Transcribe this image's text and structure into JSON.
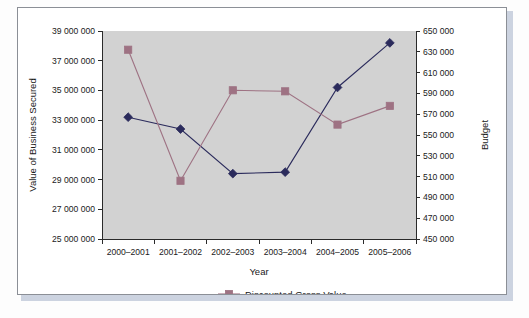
{
  "chart_data": {
    "type": "line",
    "title": "",
    "xlabel": "Year",
    "ylabel": "Value of Business Secured",
    "y2label": "Budget",
    "categories": [
      "2000–2001",
      "2001–2002",
      "2002–2003",
      "2003–2004",
      "2004–2005",
      "2005–2006"
    ],
    "ylim": [
      25000000,
      39000000
    ],
    "yticks": [
      25000000,
      27000000,
      29000000,
      31000000,
      33000000,
      35000000,
      37000000,
      39000000
    ],
    "ytick_labels": [
      "25 000 000",
      "27 000 000",
      "29 000 000",
      "31 000 000",
      "33 000 000",
      "35 000 000",
      "37 000 000",
      "39 000 000"
    ],
    "y2lim": [
      450000,
      650000
    ],
    "y2ticks": [
      450000,
      470000,
      490000,
      510000,
      530000,
      550000,
      570000,
      590000,
      610000,
      630000,
      650000
    ],
    "y2tick_labels": [
      "450 000",
      "470 000",
      "490 000",
      "510 000",
      "530 000",
      "550 000",
      "570 000",
      "590 000",
      "610 000",
      "630 000",
      "650 000"
    ],
    "grid": false,
    "legend_position": "bottom",
    "series": [
      {
        "name": "Value of Business Secured",
        "axis": "left",
        "color": "#2b2b5c",
        "marker": "diamond",
        "in_legend": false,
        "values": [
          33200000,
          32400000,
          29400000,
          29500000,
          35200000,
          38200000
        ]
      },
      {
        "name": "Discounted Gross Value",
        "axis": "right",
        "color": "#9e7283",
        "marker": "square",
        "in_legend": true,
        "values": [
          632000,
          506000,
          593000,
          592000,
          560000,
          578000
        ]
      }
    ],
    "legend": [
      {
        "label": "Discounted Gross Value",
        "color": "#9e7283",
        "marker": "square"
      }
    ],
    "colors": {
      "plot_background": "#d2d2d2",
      "figure_background": "#fdfdfd",
      "axis": "#2a2a2a",
      "series_primary": "#2b2b5c",
      "series_secondary": "#9e7283",
      "frame_border": "#8b8f96",
      "shadow": "#ccd3e0"
    }
  }
}
